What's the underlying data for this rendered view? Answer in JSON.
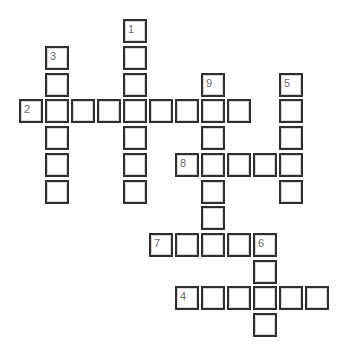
{
  "puzzle": {
    "type": "crossword",
    "grid": {
      "col_x": [
        19,
        45,
        71,
        97,
        123,
        149,
        175,
        201,
        227,
        253,
        279,
        305
      ],
      "row_y": [
        19,
        46,
        73,
        99,
        126,
        153,
        180,
        206,
        233,
        260,
        286,
        313
      ]
    },
    "clue_numbers": [
      {
        "number": "1",
        "col": 4,
        "row": 0
      },
      {
        "number": "2",
        "col": 0,
        "row": 3
      },
      {
        "number": "3",
        "col": 1,
        "row": 1
      },
      {
        "number": "4",
        "col": 6,
        "row": 10
      },
      {
        "number": "5",
        "col": 10,
        "row": 2
      },
      {
        "number": "6",
        "col": 9,
        "row": 8
      },
      {
        "number": "7",
        "col": 5,
        "row": 8
      },
      {
        "number": "8",
        "col": 6,
        "row": 5
      },
      {
        "number": "9",
        "col": 7,
        "row": 2
      }
    ],
    "words": [
      {
        "number": "1",
        "direction": "down",
        "start_col": 4,
        "start_row": 0,
        "length": 7
      },
      {
        "number": "2",
        "direction": "across",
        "start_col": 0,
        "start_row": 3,
        "length": 9
      },
      {
        "number": "3",
        "direction": "down",
        "start_col": 1,
        "start_row": 1,
        "length": 6
      },
      {
        "number": "4",
        "direction": "across",
        "start_col": 6,
        "start_row": 10,
        "length": 6
      },
      {
        "number": "5",
        "direction": "down",
        "start_col": 10,
        "start_row": 2,
        "length": 5
      },
      {
        "number": "6",
        "direction": "down",
        "start_col": 9,
        "start_row": 8,
        "length": 4
      },
      {
        "number": "7",
        "direction": "across",
        "start_col": 5,
        "start_row": 8,
        "length": 5
      },
      {
        "number": "8",
        "direction": "across",
        "start_col": 6,
        "start_row": 5,
        "length": 5
      },
      {
        "number": "9",
        "direction": "down",
        "start_col": 7,
        "start_row": 2,
        "length": 7
      }
    ]
  }
}
